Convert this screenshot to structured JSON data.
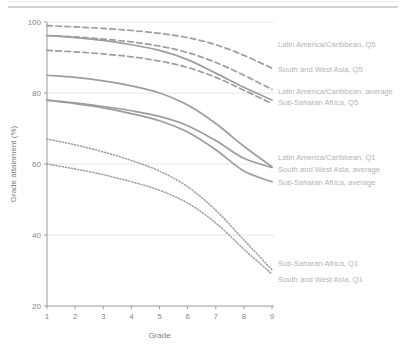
{
  "chart_data": {
    "type": "line",
    "title": "",
    "xlabel": "Grade",
    "ylabel": "Grade attainment (%)",
    "x": [
      1,
      2,
      3,
      4,
      5,
      6,
      7,
      8,
      9
    ],
    "xlim": [
      1,
      9
    ],
    "ylim": [
      20,
      100
    ],
    "xticks": [
      "1",
      "2",
      "3",
      "4",
      "5",
      "6",
      "7",
      "8",
      "9"
    ],
    "yticks": [
      "20",
      "40",
      "60",
      "80",
      "100"
    ],
    "grid": "horizontal",
    "legend_position": "right-inline",
    "series": [
      {
        "name": "Latin America/Caribbean, Q5",
        "style": "dashed",
        "color": "#9d9d9d",
        "values": [
          99.0,
          98.6,
          98.2,
          97.6,
          96.8,
          95.6,
          93.6,
          90.6,
          87.0
        ],
        "label_y": 93.6
      },
      {
        "name": "South and West Asia, Q5",
        "style": "dashed",
        "color": "#9d9d9d",
        "values": [
          96.2,
          95.8,
          95.2,
          94.4,
          93.2,
          91.4,
          88.6,
          85.0,
          81.0
        ],
        "label_y": 86.4
      },
      {
        "name": "Latin America/Caribbean, average",
        "style": "solid",
        "color": "#9d9d9d",
        "values": [
          96.2,
          95.6,
          94.8,
          93.6,
          92.0,
          89.4,
          85.6,
          81.6,
          78.0
        ],
        "label_y": 80.4
      },
      {
        "name": "Sub-Saharan Africa, Q5",
        "style": "dashed",
        "color": "#9d9d9d",
        "values": [
          92.0,
          91.6,
          91.0,
          90.2,
          89.0,
          87.2,
          84.4,
          80.8,
          77.0
        ],
        "label_y": 77.2
      },
      {
        "name": "South and West Asia, average",
        "style": "solid",
        "color": "#9d9d9d",
        "values": [
          85.0,
          84.4,
          83.4,
          82.0,
          80.0,
          76.6,
          71.4,
          65.0,
          59.2
        ],
        "label_y": 58.4
      },
      {
        "name": "Latin America/Caribbean, Q1",
        "style": "solid",
        "color": "#9d9d9d",
        "values": [
          78.0,
          77.2,
          76.2,
          75.0,
          73.4,
          70.8,
          66.6,
          61.6,
          59.0
        ],
        "label_y": 61.8
      },
      {
        "name": "Sub-Saharan Africa, average",
        "style": "solid",
        "color": "#9d9d9d",
        "values": [
          78.0,
          77.0,
          75.8,
          74.2,
          72.2,
          69.0,
          64.0,
          58.0,
          55.0
        ],
        "label_y": 54.6
      },
      {
        "name": "Sub-Saharan Africa, Q1",
        "style": "dotted",
        "color": "#a8a8a8",
        "values": [
          67.0,
          65.4,
          63.4,
          61.0,
          58.0,
          53.6,
          47.0,
          38.6,
          30.2
        ],
        "label_y": 31.8
      },
      {
        "name": "South and West Asia, Q1",
        "style": "dotted",
        "color": "#a8a8a8",
        "values": [
          60.0,
          58.6,
          57.0,
          55.0,
          52.6,
          49.0,
          43.4,
          36.0,
          29.0
        ],
        "label_y": 27.4
      }
    ],
    "labels": [
      {
        "text": "Latin America/Caribbean, Q5",
        "at_y": 93.6
      },
      {
        "text": "South and West Asia, Q5",
        "at_y": 86.4
      },
      {
        "text": "Latin America/Caribbean, average",
        "at_y": 80.4
      },
      {
        "text": "Sub-Saharan Africa, Q5",
        "at_y": 77.2
      },
      {
        "text": "Latin America/Caribbean, Q1",
        "at_y": 61.8
      },
      {
        "text": "South and West Asia, average",
        "at_y": 58.4
      },
      {
        "text": "Sub-Saharan Africa, average",
        "at_y": 54.6
      },
      {
        "text": "Sub-Saharan Africa, Q1",
        "at_y": 31.8
      },
      {
        "text": "South and West Asia, Q1",
        "at_y": 27.4
      }
    ]
  }
}
